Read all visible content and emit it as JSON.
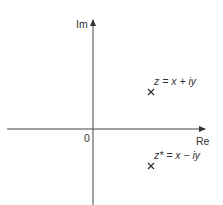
{
  "diagram": {
    "axes": {
      "vertical_label": "Im",
      "horizontal_label": "Re",
      "origin_label": "0"
    },
    "points": [
      {
        "name": "z",
        "label": "z = x + iy",
        "marker": "×"
      },
      {
        "name": "z-conjugate",
        "label": "z* = x − iy",
        "marker": "×"
      }
    ],
    "colors": {
      "line": "#333333",
      "text": "#333333",
      "background": "#ffffff"
    }
  }
}
